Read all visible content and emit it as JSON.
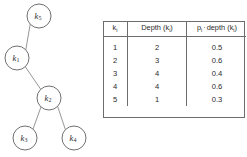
{
  "figure": {
    "tree": {
      "name": "binary-search-tree",
      "nodes": [
        {
          "id": "k5",
          "label": "k",
          "subscript": "5",
          "cx": 39,
          "cy": 16,
          "r": 12
        },
        {
          "id": "k1",
          "label": "k",
          "subscript": "1",
          "cx": 17,
          "cy": 58,
          "r": 12
        },
        {
          "id": "k2",
          "label": "k",
          "subscript": "2",
          "cx": 49,
          "cy": 98,
          "r": 12
        },
        {
          "id": "k3",
          "label": "k",
          "subscript": "3",
          "cx": 25,
          "cy": 138,
          "r": 12
        },
        {
          "id": "k4",
          "label": "k",
          "subscript": "4",
          "cx": 74,
          "cy": 138,
          "r": 12
        }
      ],
      "edges": [
        {
          "from": "k5",
          "to": "k1"
        },
        {
          "from": "k1",
          "to": "k2"
        },
        {
          "from": "k2",
          "to": "k3"
        },
        {
          "from": "k2",
          "to": "k4"
        }
      ]
    },
    "table": {
      "name": "depth-cost-table",
      "columns": [
        {
          "key": "k",
          "label": "k",
          "subscript": "i"
        },
        {
          "key": "depth",
          "label": "Depth (k",
          "subscript": "i",
          "label_suffix": ")"
        },
        {
          "key": "prod",
          "label": "p",
          "subscript": "i",
          "operator": "·",
          "label_mid": "depth (k",
          "subscript2": "i",
          "label_suffix": ")"
        }
      ],
      "rows": [
        {
          "k": "1",
          "depth": "2",
          "prod": "0.5"
        },
        {
          "k": "2",
          "depth": "3",
          "prod": "0.6"
        },
        {
          "k": "3",
          "depth": "4",
          "prod": "0.4"
        },
        {
          "k": "4",
          "depth": "4",
          "prod": "0.6"
        },
        {
          "k": "5",
          "depth": "1",
          "prod": "0.3"
        }
      ]
    }
  },
  "colors": {
    "background": "#ffffff",
    "node_stroke": "#5f5f5f",
    "edge_stroke": "#8a8a8a",
    "table_border": "#6d6d6d",
    "text": "#2b2b2b"
  }
}
